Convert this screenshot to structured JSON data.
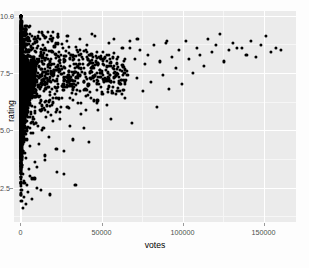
{
  "chart_data": {
    "type": "scatter",
    "title": "",
    "xlabel": "votes",
    "ylabel": "rating",
    "xlim": [
      -4000,
      170000
    ],
    "ylim": [
      1.0,
      10.2
    ],
    "grid": true,
    "legend": null,
    "x_ticks": [
      0,
      50000,
      100000,
      150000
    ],
    "x_tick_labels": [
      "0",
      "50000",
      "100000",
      "150000"
    ],
    "y_ticks": [
      2.5,
      5.0,
      7.5,
      10.0
    ],
    "y_tick_labels": [
      "2.5",
      "5.0",
      "7.5",
      "10.0"
    ],
    "x_minor_ticks": [
      25000,
      75000,
      125000
    ],
    "y_minor_ticks": [
      1.25,
      3.75,
      6.25,
      8.75
    ],
    "marker": {
      "shape": "circle",
      "color": "#000000",
      "size": 3.1
    },
    "panel_background": "#ebebeb",
    "grid_color": "#ffffff",
    "grid_minor_color": "#f6f6f6",
    "points": [
      [
        60,
        9.9
      ],
      [
        80,
        9.6
      ],
      [
        110,
        9.3
      ],
      [
        140,
        9.1
      ],
      [
        170,
        8.8
      ],
      [
        200,
        9.5
      ],
      [
        230,
        8.4
      ],
      [
        260,
        9.0
      ],
      [
        300,
        7.2
      ],
      [
        330,
        8.1
      ],
      [
        360,
        6.4
      ],
      [
        400,
        9.2
      ],
      [
        430,
        7.6
      ],
      [
        470,
        5.3
      ],
      [
        500,
        8.7
      ],
      [
        540,
        6.9
      ],
      [
        580,
        4.2
      ],
      [
        620,
        7.9
      ],
      [
        660,
        9.4
      ],
      [
        700,
        6.1
      ],
      [
        740,
        8.3
      ],
      [
        790,
        3.5
      ],
      [
        830,
        7.4
      ],
      [
        880,
        5.8
      ],
      [
        920,
        8.9
      ],
      [
        970,
        6.6
      ],
      [
        1020,
        7.1
      ],
      [
        1070,
        4.8
      ],
      [
        1120,
        8.5
      ],
      [
        1170,
        9.7
      ],
      [
        1230,
        5.5
      ],
      [
        1280,
        7.7
      ],
      [
        1340,
        6.2
      ],
      [
        1400,
        8.0
      ],
      [
        1460,
        3.1
      ],
      [
        1520,
        7.3
      ],
      [
        1580,
        9.1
      ],
      [
        1650,
        5.0
      ],
      [
        1710,
        8.6
      ],
      [
        1780,
        6.8
      ],
      [
        1850,
        7.5
      ],
      [
        1920,
        4.5
      ],
      [
        1990,
        8.2
      ],
      [
        2060,
        9.3
      ],
      [
        2140,
        5.7
      ],
      [
        2210,
        7.0
      ],
      [
        2290,
        6.3
      ],
      [
        2370,
        8.8
      ],
      [
        2450,
        2.7
      ],
      [
        2530,
        7.8
      ],
      [
        2620,
        5.2
      ],
      [
        2700,
        8.4
      ],
      [
        2790,
        6.7
      ],
      [
        2880,
        7.2
      ],
      [
        2970,
        4.0
      ],
      [
        3060,
        9.0
      ],
      [
        3160,
        5.9
      ],
      [
        3250,
        8.1
      ],
      [
        3350,
        6.5
      ],
      [
        3450,
        7.6
      ],
      [
        3560,
        3.8
      ],
      [
        3660,
        8.7
      ],
      [
        3770,
        5.4
      ],
      [
        3880,
        7.1
      ],
      [
        3990,
        6.0
      ],
      [
        4110,
        9.2
      ],
      [
        4220,
        4.6
      ],
      [
        4340,
        8.3
      ],
      [
        4460,
        7.4
      ],
      [
        4590,
        5.6
      ],
      [
        4710,
        6.9
      ],
      [
        4840,
        8.0
      ],
      [
        4970,
        3.3
      ],
      [
        5110,
        7.7
      ],
      [
        5240,
        9.5
      ],
      [
        5380,
        6.2
      ],
      [
        5520,
        8.5
      ],
      [
        5670,
        5.1
      ],
      [
        5810,
        7.3
      ],
      [
        5960,
        4.3
      ],
      [
        6110,
        8.9
      ],
      [
        6270,
        6.6
      ],
      [
        6430,
        7.9
      ],
      [
        6590,
        5.8
      ],
      [
        6750,
        8.2
      ],
      [
        6920,
        2.9
      ],
      [
        7090,
        7.0
      ],
      [
        7260,
        6.4
      ],
      [
        7440,
        8.6
      ],
      [
        7620,
        4.9
      ],
      [
        7800,
        7.5
      ],
      [
        7990,
        5.5
      ],
      [
        8180,
        8.1
      ],
      [
        8370,
        6.8
      ],
      [
        8570,
        7.2
      ],
      [
        8770,
        3.6
      ],
      [
        8970,
        8.8
      ],
      [
        9180,
        6.0
      ],
      [
        9390,
        7.6
      ],
      [
        9600,
        5.3
      ],
      [
        9820,
        8.4
      ],
      [
        10000,
        2.5
      ],
      [
        10300,
        7.1
      ],
      [
        10600,
        6.5
      ],
      [
        10900,
        8.0
      ],
      [
        11200,
        4.4
      ],
      [
        11500,
        7.8
      ],
      [
        11800,
        9.0
      ],
      [
        12100,
        5.9
      ],
      [
        12400,
        8.3
      ],
      [
        12800,
        6.3
      ],
      [
        13100,
        7.4
      ],
      [
        13500,
        5.0
      ],
      [
        13900,
        8.7
      ],
      [
        14300,
        6.7
      ],
      [
        14700,
        7.9
      ],
      [
        15100,
        3.9
      ],
      [
        15500,
        8.5
      ],
      [
        15900,
        5.6
      ],
      [
        16300,
        7.3
      ],
      [
        16800,
        6.9
      ],
      [
        17200,
        8.1
      ],
      [
        17700,
        4.7
      ],
      [
        18200,
        7.7
      ],
      [
        18700,
        9.1
      ],
      [
        19200,
        6.1
      ],
      [
        19700,
        8.4
      ],
      [
        20200,
        5.4
      ],
      [
        20800,
        7.5
      ],
      [
        21300,
        6.6
      ],
      [
        21900,
        8.8
      ],
      [
        22500,
        3.2
      ],
      [
        23100,
        7.0
      ],
      [
        23700,
        8.2
      ],
      [
        24300,
        5.8
      ],
      [
        25000,
        7.8
      ],
      [
        25600,
        6.4
      ],
      [
        26300,
        8.6
      ],
      [
        27000,
        4.1
      ],
      [
        27700,
        7.2
      ],
      [
        28400,
        8.9
      ],
      [
        29100,
        6.0
      ],
      [
        29900,
        7.6
      ],
      [
        30600,
        5.2
      ],
      [
        31400,
        8.3
      ],
      [
        32200,
        6.8
      ],
      [
        33000,
        7.9
      ],
      [
        33900,
        2.6
      ],
      [
        34700,
        8.5
      ],
      [
        35600,
        6.2
      ],
      [
        36500,
        7.4
      ],
      [
        37400,
        5.7
      ],
      [
        38300,
        8.1
      ],
      [
        39300,
        7.1
      ],
      [
        40200,
        6.5
      ],
      [
        41200,
        8.7
      ],
      [
        42200,
        4.5
      ],
      [
        43300,
        7.7
      ],
      [
        44300,
        9.2
      ],
      [
        45400,
        6.3
      ],
      [
        46500,
        8.0
      ],
      [
        47600,
        5.9
      ],
      [
        48800,
        7.5
      ],
      [
        49900,
        6.9
      ],
      [
        51100,
        8.4
      ],
      [
        52300,
        7.2
      ],
      [
        53600,
        6.1
      ],
      [
        54800,
        8.8
      ],
      [
        56100,
        5.5
      ],
      [
        57400,
        7.8
      ],
      [
        58800,
        6.6
      ],
      [
        60100,
        8.2
      ],
      [
        61500,
        7.0
      ],
      [
        62900,
        8.6
      ],
      [
        64400,
        6.4
      ],
      [
        65800,
        7.6
      ],
      [
        67300,
        8.9
      ],
      [
        68900,
        5.3
      ],
      [
        70400,
        8.1
      ],
      [
        72000,
        7.3
      ],
      [
        73600,
        8.5
      ],
      [
        75300,
        6.7
      ],
      [
        77000,
        7.9
      ],
      [
        78700,
        8.3
      ],
      [
        80400,
        7.1
      ],
      [
        82200,
        8.7
      ],
      [
        84000,
        6.0
      ],
      [
        85900,
        8.0
      ],
      [
        87800,
        7.4
      ],
      [
        89700,
        8.8
      ],
      [
        91700,
        6.8
      ],
      [
        93700,
        8.2
      ],
      [
        95700,
        7.7
      ],
      [
        97800,
        8.5
      ],
      [
        99900,
        7.0
      ],
      [
        102000,
        8.9
      ],
      [
        104200,
        8.1
      ],
      [
        106400,
        7.5
      ],
      [
        108700,
        8.6
      ],
      [
        111000,
        8.3
      ],
      [
        113400,
        7.8
      ],
      [
        115800,
        9.0
      ],
      [
        118200,
        8.4
      ],
      [
        120700,
        8.7
      ],
      [
        123200,
        9.2
      ],
      [
        125800,
        8.0
      ],
      [
        128400,
        8.5
      ],
      [
        131100,
        8.8
      ],
      [
        133800,
        8.6
      ],
      [
        136600,
        8.6
      ],
      [
        139400,
        8.3
      ],
      [
        142300,
        8.9
      ],
      [
        145200,
        8.2
      ],
      [
        148200,
        8.7
      ],
      [
        151200,
        9.1
      ],
      [
        154300,
        8.4
      ],
      [
        157400,
        8.6
      ],
      [
        160600,
        8.5
      ],
      [
        300,
        2.2
      ],
      [
        600,
        1.9
      ],
      [
        900,
        2.4
      ],
      [
        1400,
        1.6
      ],
      [
        1900,
        2.8
      ],
      [
        2400,
        2.1
      ],
      [
        3100,
        1.8
      ],
      [
        3900,
        2.6
      ],
      [
        4800,
        2.3
      ],
      [
        5900,
        3.0
      ],
      [
        7100,
        2.0
      ],
      [
        8600,
        2.9
      ],
      [
        10400,
        3.4
      ],
      [
        12600,
        2.4
      ],
      [
        15200,
        3.7
      ],
      [
        18400,
        2.2
      ],
      [
        22200,
        4.2
      ],
      [
        26800,
        3.1
      ],
      [
        32400,
        4.6
      ],
      [
        39100,
        5.1
      ],
      [
        47200,
        6.2
      ],
      [
        57000,
        6.9
      ],
      [
        120,
        9.8
      ],
      [
        250,
        9.4
      ],
      [
        420,
        9.6
      ],
      [
        640,
        9.2
      ],
      [
        910,
        9.5
      ],
      [
        1250,
        9.3
      ],
      [
        1680,
        9.0
      ],
      [
        2200,
        9.4
      ],
      [
        2850,
        9.1
      ],
      [
        3650,
        9.3
      ],
      [
        4600,
        9.0
      ],
      [
        5800,
        9.2
      ],
      [
        7300,
        9.1
      ],
      [
        9200,
        9.0
      ],
      [
        11600,
        9.3
      ],
      [
        14600,
        9.1
      ],
      [
        18400,
        9.0
      ],
      [
        23100,
        9.2
      ],
      [
        29000,
        9.1
      ],
      [
        36500,
        9.0
      ],
      [
        45800,
        9.1
      ],
      [
        57500,
        9.0
      ],
      [
        72200,
        9.0
      ],
      [
        90600,
        8.9
      ],
      [
        100,
        8.0
      ],
      [
        180,
        7.5
      ],
      [
        270,
        8.3
      ],
      [
        380,
        6.7
      ],
      [
        510,
        7.8
      ],
      [
        670,
        8.6
      ],
      [
        860,
        7.0
      ],
      [
        1090,
        8.1
      ],
      [
        1360,
        6.3
      ],
      [
        1680,
        7.6
      ],
      [
        2050,
        8.4
      ],
      [
        2480,
        7.2
      ],
      [
        2970,
        6.8
      ],
      [
        3530,
        8.0
      ],
      [
        4170,
        7.4
      ],
      [
        4900,
        8.5
      ],
      [
        5730,
        6.9
      ],
      [
        6670,
        7.7
      ],
      [
        7740,
        8.2
      ],
      [
        8950,
        7.1
      ],
      [
        10300,
        7.9
      ],
      [
        11900,
        6.5
      ],
      [
        13700,
        8.3
      ],
      [
        15700,
        7.3
      ],
      [
        18000,
        8.0
      ],
      [
        20600,
        7.6
      ],
      [
        23600,
        8.4
      ],
      [
        27000,
        7.0
      ],
      [
        30800,
        8.1
      ],
      [
        35200,
        7.8
      ],
      [
        40200,
        8.5
      ],
      [
        45800,
        7.4
      ],
      [
        52200,
        8.2
      ],
      [
        59400,
        7.9
      ],
      [
        67600,
        8.6
      ],
      [
        150,
        5.5
      ],
      [
        320,
        4.8
      ],
      [
        560,
        5.9
      ],
      [
        880,
        4.3
      ],
      [
        1290,
        5.2
      ],
      [
        1800,
        6.0
      ],
      [
        2430,
        4.6
      ],
      [
        3190,
        5.7
      ],
      [
        4100,
        5.0
      ],
      [
        5180,
        6.1
      ],
      [
        6460,
        4.9
      ],
      [
        7960,
        5.6
      ],
      [
        9720,
        5.3
      ],
      [
        11800,
        6.2
      ],
      [
        14200,
        5.1
      ],
      [
        17000,
        5.8
      ],
      [
        20300,
        6.4
      ],
      [
        24200,
        5.5
      ],
      [
        28700,
        6.0
      ],
      [
        34000,
        6.6
      ],
      [
        40200,
        5.9
      ],
      [
        47500,
        6.3
      ],
      [
        56000,
        7.1
      ],
      [
        66000,
        7.4
      ]
    ]
  }
}
